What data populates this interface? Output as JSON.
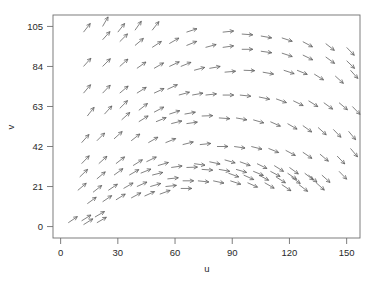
{
  "figure": {
    "background_color": "#ffffff",
    "frame_color": "#6f6f6f",
    "arrow_color": "#5a5a5a",
    "plot_left": 53,
    "plot_top": 15,
    "plot_right": 360,
    "plot_bottom": 238
  },
  "axes": {
    "x_title": "u",
    "y_title": "v",
    "x_ticks": [
      0,
      30,
      60,
      90,
      120,
      150
    ],
    "y_ticks": [
      0,
      21,
      42,
      63,
      84,
      105
    ],
    "x_tick_labels": [
      "0",
      "30",
      "60",
      "90",
      "120",
      "150"
    ],
    "y_tick_labels": [
      "0",
      "21",
      "42",
      "63",
      "84",
      "105"
    ]
  },
  "chart_data": {
    "type": "scatter",
    "subtype": "quiver",
    "title": "",
    "subtitle": "",
    "xlabel": "u",
    "ylabel": "v",
    "xlim": [
      -4,
      157
    ],
    "ylim": [
      -6,
      111
    ],
    "xticks": [
      0,
      30,
      60,
      90,
      120,
      150
    ],
    "yticks": [
      0,
      21,
      42,
      63,
      84,
      105
    ],
    "grid": false,
    "legend": null,
    "annotations": [],
    "arrow_length_px": 11,
    "vectors": [
      {
        "x": 12,
        "y": 102,
        "angle": 52
      },
      {
        "x": 22,
        "y": 105,
        "angle": 60
      },
      {
        "x": 22,
        "y": 98,
        "angle": 48
      },
      {
        "x": 30,
        "y": 102,
        "angle": 52
      },
      {
        "x": 31,
        "y": 97,
        "angle": 45
      },
      {
        "x": 39,
        "y": 103,
        "angle": 55
      },
      {
        "x": 39,
        "y": 95,
        "angle": 40
      },
      {
        "x": 48,
        "y": 103,
        "angle": 52
      },
      {
        "x": 48,
        "y": 94,
        "angle": 33
      },
      {
        "x": 57,
        "y": 96,
        "angle": 30
      },
      {
        "x": 66,
        "y": 102,
        "angle": 18
      },
      {
        "x": 66,
        "y": 95,
        "angle": 22
      },
      {
        "x": 76,
        "y": 94,
        "angle": 15
      },
      {
        "x": 85,
        "y": 102,
        "angle": 6
      },
      {
        "x": 85,
        "y": 94,
        "angle": 8
      },
      {
        "x": 95,
        "y": 101,
        "angle": -4
      },
      {
        "x": 95,
        "y": 93,
        "angle": 0
      },
      {
        "x": 105,
        "y": 100,
        "angle": -10
      },
      {
        "x": 105,
        "y": 92,
        "angle": -8
      },
      {
        "x": 116,
        "y": 99,
        "angle": -18
      },
      {
        "x": 116,
        "y": 91,
        "angle": -18
      },
      {
        "x": 127,
        "y": 97,
        "angle": -28
      },
      {
        "x": 127,
        "y": 90,
        "angle": -26
      },
      {
        "x": 139,
        "y": 96,
        "angle": -38
      },
      {
        "x": 139,
        "y": 89,
        "angle": -36
      },
      {
        "x": 150,
        "y": 94,
        "angle": -46
      },
      {
        "x": 150,
        "y": 87,
        "angle": -44
      },
      {
        "x": 12,
        "y": 84,
        "angle": 48
      },
      {
        "x": 22,
        "y": 84,
        "angle": 45
      },
      {
        "x": 31,
        "y": 84,
        "angle": 42
      },
      {
        "x": 40,
        "y": 83,
        "angle": 35
      },
      {
        "x": 49,
        "y": 83,
        "angle": 30
      },
      {
        "x": 57,
        "y": 84,
        "angle": 25
      },
      {
        "x": 63,
        "y": 84,
        "angle": 22
      },
      {
        "x": 70,
        "y": 82,
        "angle": 15
      },
      {
        "x": 78,
        "y": 83,
        "angle": 10
      },
      {
        "x": 86,
        "y": 81,
        "angle": 5
      },
      {
        "x": 96,
        "y": 82,
        "angle": -2
      },
      {
        "x": 106,
        "y": 81,
        "angle": -10
      },
      {
        "x": 117,
        "y": 82,
        "angle": -18
      },
      {
        "x": 124,
        "y": 82,
        "angle": -22
      },
      {
        "x": 133,
        "y": 80,
        "angle": -32
      },
      {
        "x": 144,
        "y": 79,
        "angle": -42
      },
      {
        "x": 152,
        "y": 82,
        "angle": -48
      },
      {
        "x": 12,
        "y": 70,
        "angle": 50
      },
      {
        "x": 22,
        "y": 70,
        "angle": 46
      },
      {
        "x": 31,
        "y": 70,
        "angle": 40
      },
      {
        "x": 40,
        "y": 70,
        "angle": 32
      },
      {
        "x": 49,
        "y": 70,
        "angle": 25
      },
      {
        "x": 56,
        "y": 72,
        "angle": 25
      },
      {
        "x": 62,
        "y": 69,
        "angle": 15
      },
      {
        "x": 69,
        "y": 69,
        "angle": 10
      },
      {
        "x": 76,
        "y": 69,
        "angle": 6
      },
      {
        "x": 85,
        "y": 69,
        "angle": 0
      },
      {
        "x": 94,
        "y": 69,
        "angle": -6
      },
      {
        "x": 104,
        "y": 68,
        "angle": -12
      },
      {
        "x": 113,
        "y": 67,
        "angle": -20
      },
      {
        "x": 122,
        "y": 66,
        "angle": -26
      },
      {
        "x": 130,
        "y": 66,
        "angle": -32
      },
      {
        "x": 138,
        "y": 65,
        "angle": -36
      },
      {
        "x": 146,
        "y": 65,
        "angle": -40
      },
      {
        "x": 153,
        "y": 63,
        "angle": -46
      },
      {
        "x": 14,
        "y": 58,
        "angle": 52
      },
      {
        "x": 23,
        "y": 59,
        "angle": 48
      },
      {
        "x": 31,
        "y": 62,
        "angle": 45
      },
      {
        "x": 32,
        "y": 56,
        "angle": 42
      },
      {
        "x": 41,
        "y": 61,
        "angle": 38
      },
      {
        "x": 41,
        "y": 55,
        "angle": 32
      },
      {
        "x": 49,
        "y": 60,
        "angle": 28
      },
      {
        "x": 50,
        "y": 55,
        "angle": 22
      },
      {
        "x": 57,
        "y": 59,
        "angle": 18
      },
      {
        "x": 58,
        "y": 54,
        "angle": 14
      },
      {
        "x": 65,
        "y": 59,
        "angle": 10
      },
      {
        "x": 66,
        "y": 54,
        "angle": 8
      },
      {
        "x": 74,
        "y": 58,
        "angle": 2
      },
      {
        "x": 83,
        "y": 57,
        "angle": -4
      },
      {
        "x": 92,
        "y": 57,
        "angle": -10
      },
      {
        "x": 101,
        "y": 56,
        "angle": -16
      },
      {
        "x": 110,
        "y": 55,
        "angle": -24
      },
      {
        "x": 119,
        "y": 54,
        "angle": -30
      },
      {
        "x": 127,
        "y": 53,
        "angle": -36
      },
      {
        "x": 135,
        "y": 52,
        "angle": -42
      },
      {
        "x": 143,
        "y": 51,
        "angle": -46
      },
      {
        "x": 151,
        "y": 50,
        "angle": -50
      },
      {
        "x": 11,
        "y": 44,
        "angle": 48
      },
      {
        "x": 19,
        "y": 45,
        "angle": 45
      },
      {
        "x": 28,
        "y": 46,
        "angle": 42
      },
      {
        "x": 37,
        "y": 45,
        "angle": 38
      },
      {
        "x": 46,
        "y": 44,
        "angle": 30
      },
      {
        "x": 55,
        "y": 44,
        "angle": 22
      },
      {
        "x": 64,
        "y": 43,
        "angle": 14
      },
      {
        "x": 73,
        "y": 43,
        "angle": 6
      },
      {
        "x": 82,
        "y": 42,
        "angle": 0
      },
      {
        "x": 91,
        "y": 42,
        "angle": -8
      },
      {
        "x": 100,
        "y": 42,
        "angle": -14
      },
      {
        "x": 109,
        "y": 41,
        "angle": -22
      },
      {
        "x": 118,
        "y": 40,
        "angle": -28
      },
      {
        "x": 127,
        "y": 39,
        "angle": -34
      },
      {
        "x": 136,
        "y": 38,
        "angle": -40
      },
      {
        "x": 145,
        "y": 37,
        "angle": -46
      },
      {
        "x": 152,
        "y": 41,
        "angle": -50
      },
      {
        "x": 11,
        "y": 33,
        "angle": 46
      },
      {
        "x": 20,
        "y": 33,
        "angle": 42
      },
      {
        "x": 29,
        "y": 33,
        "angle": 38
      },
      {
        "x": 38,
        "y": 32,
        "angle": 32
      },
      {
        "x": 45,
        "y": 34,
        "angle": 26
      },
      {
        "x": 51,
        "y": 32,
        "angle": 16
      },
      {
        "x": 58,
        "y": 31,
        "angle": 8
      },
      {
        "x": 66,
        "y": 31,
        "angle": 2
      },
      {
        "x": 74,
        "y": 30,
        "angle": -4
      },
      {
        "x": 83,
        "y": 30,
        "angle": -10
      },
      {
        "x": 92,
        "y": 30,
        "angle": -16
      },
      {
        "x": 101,
        "y": 29,
        "angle": -22
      },
      {
        "x": 110,
        "y": 29,
        "angle": -28
      },
      {
        "x": 119,
        "y": 28,
        "angle": -34
      },
      {
        "x": 128,
        "y": 28,
        "angle": -38
      },
      {
        "x": 137,
        "y": 27,
        "angle": -42
      },
      {
        "x": 146,
        "y": 29,
        "angle": -46
      },
      {
        "x": 10,
        "y": 26,
        "angle": 44
      },
      {
        "x": 19,
        "y": 25,
        "angle": 40
      },
      {
        "x": 28,
        "y": 27,
        "angle": 36
      },
      {
        "x": 36,
        "y": 27,
        "angle": 30
      },
      {
        "x": 42,
        "y": 28,
        "angle": 22
      },
      {
        "x": 48,
        "y": 27,
        "angle": 14
      },
      {
        "x": 56,
        "y": 25,
        "angle": 6
      },
      {
        "x": 64,
        "y": 24,
        "angle": 0
      },
      {
        "x": 72,
        "y": 24,
        "angle": -6
      },
      {
        "x": 80,
        "y": 24,
        "angle": -12
      },
      {
        "x": 89,
        "y": 24,
        "angle": -18
      },
      {
        "x": 98,
        "y": 23,
        "angle": -24
      },
      {
        "x": 107,
        "y": 23,
        "angle": -30
      },
      {
        "x": 116,
        "y": 22,
        "angle": -34
      },
      {
        "x": 125,
        "y": 22,
        "angle": -38
      },
      {
        "x": 134,
        "y": 23,
        "angle": -42
      },
      {
        "x": 9,
        "y": 19,
        "angle": 40
      },
      {
        "x": 17,
        "y": 18,
        "angle": 38
      },
      {
        "x": 25,
        "y": 19,
        "angle": 34
      },
      {
        "x": 33,
        "y": 20,
        "angle": 30
      },
      {
        "x": 40,
        "y": 21,
        "angle": 24
      },
      {
        "x": 47,
        "y": 21,
        "angle": 16
      },
      {
        "x": 55,
        "y": 21,
        "angle": 6
      },
      {
        "x": 63,
        "y": 20,
        "angle": 0
      },
      {
        "x": 14,
        "y": 12,
        "angle": 36
      },
      {
        "x": 22,
        "y": 13,
        "angle": 34
      },
      {
        "x": 29,
        "y": 14,
        "angle": 32
      },
      {
        "x": 37,
        "y": 15,
        "angle": 28
      },
      {
        "x": 44,
        "y": 16,
        "angle": 24
      },
      {
        "x": 52,
        "y": 17,
        "angle": 20
      },
      {
        "x": 4,
        "y": 2,
        "angle": 34
      },
      {
        "x": 11,
        "y": 3,
        "angle": 32
      },
      {
        "x": 18,
        "y": 5,
        "angle": 30
      },
      {
        "x": 12,
        "y": 1,
        "angle": 32
      },
      {
        "x": 19,
        "y": 2,
        "angle": 30
      },
      {
        "x": 70,
        "y": 33,
        "angle": -8
      },
      {
        "x": 78,
        "y": 34,
        "angle": -12
      },
      {
        "x": 86,
        "y": 35,
        "angle": -16
      },
      {
        "x": 94,
        "y": 34,
        "angle": -20
      },
      {
        "x": 103,
        "y": 33,
        "angle": -26
      },
      {
        "x": 112,
        "y": 32,
        "angle": -32
      },
      {
        "x": 120,
        "y": 31,
        "angle": -36
      },
      {
        "x": 88,
        "y": 28,
        "angle": -20
      },
      {
        "x": 96,
        "y": 27,
        "angle": -24
      },
      {
        "x": 104,
        "y": 27,
        "angle": -28
      },
      {
        "x": 113,
        "y": 26,
        "angle": -32
      },
      {
        "x": 121,
        "y": 26,
        "angle": -36
      },
      {
        "x": 130,
        "y": 27,
        "angle": -40
      }
    ]
  }
}
